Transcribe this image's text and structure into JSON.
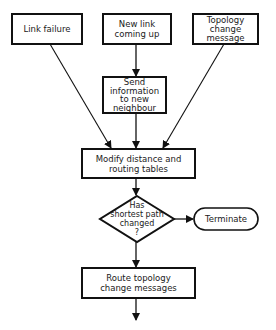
{
  "diagram": {
    "nodes": [
      {
        "id": "link_failure",
        "shape": "rect",
        "label": "Link failure"
      },
      {
        "id": "new_link",
        "shape": "rect",
        "label": "New link\ncoming up"
      },
      {
        "id": "topology_msg",
        "shape": "rect",
        "label": "Topology\nchange\nmessage"
      },
      {
        "id": "send_info",
        "shape": "rect",
        "label": "Send\ninformation\nto new\nneighbour"
      },
      {
        "id": "modify",
        "shape": "rect",
        "label": "Modify distance and\nrouting tables"
      },
      {
        "id": "decision",
        "shape": "diamond",
        "label": "Has\nshortest path\nchanged\n?"
      },
      {
        "id": "terminate",
        "shape": "rounded",
        "label": "Terminate"
      },
      {
        "id": "route",
        "shape": "rect",
        "label": "Route topology\nchange messages"
      }
    ],
    "edges": [
      {
        "from": "new_link",
        "to": "send_info"
      },
      {
        "from": "link_failure",
        "to": "modify"
      },
      {
        "from": "send_info",
        "to": "modify"
      },
      {
        "from": "topology_msg",
        "to": "modify"
      },
      {
        "from": "modify",
        "to": "decision"
      },
      {
        "from": "decision",
        "to": "terminate"
      },
      {
        "from": "decision",
        "to": "route"
      },
      {
        "from": "route",
        "to": "exit"
      }
    ],
    "colors": {
      "stroke": "#111111",
      "background": "#ffffff",
      "text": "#1a1a1a"
    }
  }
}
